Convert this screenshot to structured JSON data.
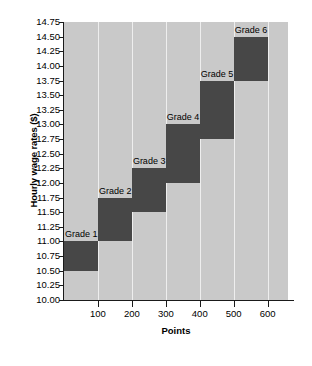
{
  "chart_data": {
    "type": "bar",
    "title": "",
    "xlabel": "Points",
    "ylabel": "Hourly wage rates ($)",
    "xlim": [
      0,
      660
    ],
    "ylim": [
      10.0,
      14.75
    ],
    "grid": true,
    "legend": "none",
    "x_ticks": [
      100,
      200,
      300,
      400,
      500,
      600
    ],
    "x_tick_labels": [
      "100",
      "200",
      "300",
      "400",
      "500",
      "600"
    ],
    "y_ticks": [
      10.0,
      10.25,
      10.5,
      10.75,
      11.0,
      11.25,
      11.5,
      11.75,
      12.0,
      12.25,
      12.5,
      12.75,
      13.0,
      13.25,
      13.5,
      13.75,
      14.0,
      14.25,
      14.5,
      14.75
    ],
    "y_tick_labels": [
      "10.00",
      "10.25",
      "10.50",
      "10.75",
      "11.00",
      "11.25",
      "11.50",
      "11.75",
      "12.00",
      "12.25",
      "12.50",
      "12.75",
      "13.00",
      "13.25",
      "13.50",
      "13.75",
      "14.00",
      "14.25",
      "14.50",
      "14.75"
    ],
    "bar_color": "#474747",
    "plot_background": "#c9c9c9",
    "gridline_color": "#eeeeee",
    "bars": [
      {
        "label": "Grade 1",
        "x_start": 0,
        "x_end": 100,
        "y_low": 10.5,
        "y_high": 11.0
      },
      {
        "label": "Grade 2",
        "x_start": 100,
        "x_end": 200,
        "y_low": 11.0,
        "y_high": 11.75
      },
      {
        "label": "Grade 3",
        "x_start": 200,
        "x_end": 300,
        "y_low": 11.5,
        "y_high": 12.25
      },
      {
        "label": "Grade 4",
        "x_start": 300,
        "x_end": 400,
        "y_low": 12.0,
        "y_high": 13.0
      },
      {
        "label": "Grade 5",
        "x_start": 400,
        "x_end": 500,
        "y_low": 12.75,
        "y_high": 13.75
      },
      {
        "label": "Grade 6",
        "x_start": 500,
        "x_end": 600,
        "y_low": 13.75,
        "y_high": 14.5
      }
    ]
  }
}
